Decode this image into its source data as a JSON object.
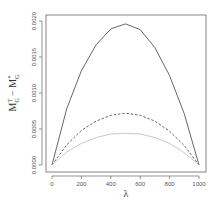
{
  "chart_data": {
    "type": "line",
    "title": "",
    "xlabel": "λ",
    "ylabel": "M_G^T − M_G^*",
    "xlim": [
      0,
      1000
    ],
    "ylim": [
      0,
      0.002
    ],
    "x_ticks": [
      "0",
      "200",
      "400",
      "600",
      "800",
      "1000"
    ],
    "y_ticks": [
      "0.0000",
      "0.0005",
      "0.0010",
      "0.0015",
      "0.0020"
    ],
    "grid": false,
    "legend": null,
    "x": [
      0,
      100,
      200,
      300,
      400,
      500,
      600,
      700,
      800,
      900,
      1000
    ],
    "series": [
      {
        "name": "solid",
        "style": "solid",
        "color": "#555555",
        "values": [
          0.0,
          0.00078,
          0.00131,
          0.00167,
          0.00189,
          0.00196,
          0.00188,
          0.00163,
          0.00124,
          0.00071,
          0.0
        ]
      },
      {
        "name": "dashed",
        "style": "dashed",
        "color": "#555555",
        "values": [
          0.0,
          0.00028,
          0.00048,
          0.00061,
          0.00069,
          0.00072,
          0.00069,
          0.00061,
          0.00047,
          0.00027,
          0.0
        ]
      },
      {
        "name": "dotted",
        "style": "dotted",
        "color": "#bbbbbb",
        "values": [
          0.0,
          0.00018,
          0.0003,
          0.00038,
          0.00043,
          0.00044,
          0.00043,
          0.00038,
          0.0003,
          0.00017,
          0.0
        ]
      }
    ]
  }
}
